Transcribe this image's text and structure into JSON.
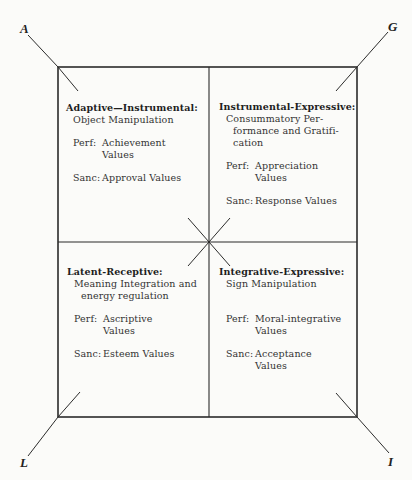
{
  "corners": {
    "top_left": "A",
    "top_right": "G",
    "bottom_left": "L",
    "bottom_right": "I"
  },
  "quadrants": {
    "top_left": {
      "title": "Adaptive—Instrumental:",
      "subtitle_lines": [
        "Object Manipulation"
      ],
      "perf_label": "Perf:",
      "perf_lines": [
        "Achievement",
        "Values"
      ],
      "sanc_label": "Sanc:",
      "sanc_lines": [
        "Approval Values"
      ]
    },
    "top_right": {
      "title": "Instrumental-Expressive:",
      "subtitle_lines": [
        "Consummatory Per-",
        "formance and Gratifi-",
        "cation"
      ],
      "perf_label": "Perf:",
      "perf_lines": [
        "Appreciation",
        "Values"
      ],
      "sanc_label": "Sanc:",
      "sanc_lines": [
        "Response Values"
      ]
    },
    "bottom_left": {
      "title": "Latent-Receptive:",
      "subtitle_lines": [
        "Meaning Integration and",
        "energy regulation"
      ],
      "perf_label": "Perf:",
      "perf_lines": [
        "Ascriptive",
        "Values"
      ],
      "sanc_label": "Sanc:",
      "sanc_lines": [
        "Esteem Values"
      ]
    },
    "bottom_right": {
      "title": "Integrative-Expressive:",
      "subtitle_lines": [
        "Sign Manipulation"
      ],
      "perf_label": "Perf:",
      "perf_lines": [
        "Moral-integrative",
        "Values"
      ],
      "sanc_label": "Sanc:",
      "sanc_lines": [
        "Acceptance",
        "Values"
      ]
    }
  },
  "colors": {
    "line": "#2b2b2b",
    "background": "#fbfbf9"
  }
}
